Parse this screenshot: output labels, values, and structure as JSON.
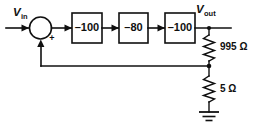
{
  "diagram": {
    "type": "circuit-block-diagram",
    "ink_color": "#101010",
    "background_color": "#ffffff",
    "signals": {
      "input": {
        "symbol": "V",
        "subscript": "in",
        "full": "Vin"
      },
      "output": {
        "symbol": "V",
        "subscript": "out",
        "full": "Vout"
      }
    },
    "summing_junction": {
      "name": "summing-junction",
      "shape": "circle",
      "signs": [
        {
          "label": "+",
          "position": "lower-right"
        }
      ],
      "inputs": [
        "Vin",
        "feedback"
      ],
      "output": "stage-1"
    },
    "blocks": [
      {
        "id": "stage-1",
        "gain": "–100"
      },
      {
        "id": "stage-2",
        "gain": "–80"
      },
      {
        "id": "stage-3",
        "gain": "–100"
      }
    ],
    "resistors": [
      {
        "id": "r-upper",
        "value": "995",
        "unit": "Ω",
        "label": "995 Ω"
      },
      {
        "id": "r-lower",
        "value": "5",
        "unit": "Ω",
        "label": "5 Ω"
      }
    ],
    "ground": {
      "name": "ground-symbol",
      "bars": 3
    },
    "feedback": {
      "name": "feedback-path",
      "from": "divider-tap-node",
      "to": "summing-junction",
      "direction": "right-to-left-then-up"
    }
  }
}
